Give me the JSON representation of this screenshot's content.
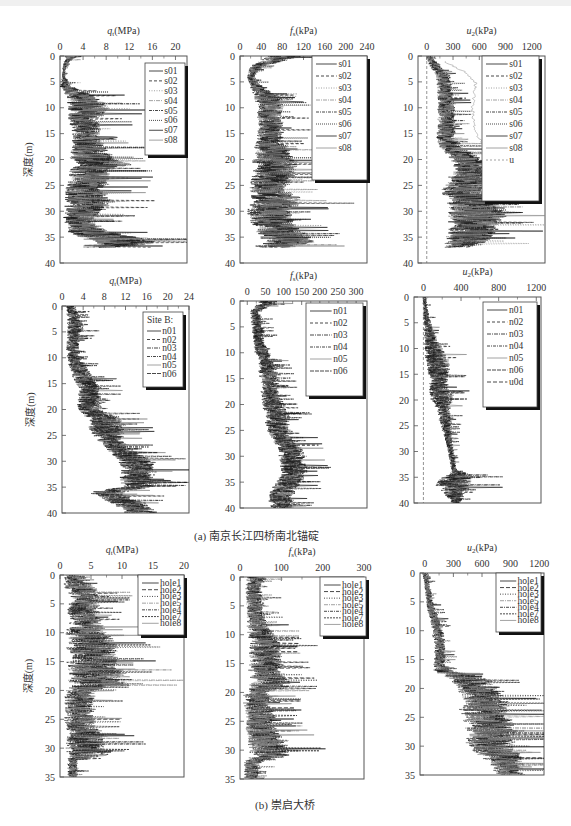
{
  "figure": {
    "caption_a": "(a) 南京长江四桥南北锚碇",
    "caption_b": "(b) 崇启大桥",
    "depth_label": "深度(m)"
  },
  "chart_data": [
    {
      "type": "line",
      "id": "a1",
      "title": "",
      "xlabel": "q_t(MPa)",
      "xlabel_main": "q",
      "xlabel_sub": "t",
      "xlabel_unit": "(MPa)",
      "ylabel": "深度(m)",
      "xlim": [
        0,
        22
      ],
      "xticks": [
        0,
        4,
        8,
        12,
        16,
        20
      ],
      "ylim": [
        0,
        40
      ],
      "yticks": [
        0,
        5,
        10,
        15,
        20,
        25,
        30,
        35,
        40
      ],
      "legend_title": "",
      "legend": [
        "s01",
        "s02",
        "s03",
        "s04",
        "s05",
        "s06",
        "s07",
        "s08"
      ],
      "legend_position": "top-right",
      "profile": {
        "depth": [
          0,
          1,
          2,
          4,
          6,
          8,
          10,
          12,
          14,
          16,
          18,
          20,
          21,
          22,
          24,
          26,
          28,
          30,
          32,
          34,
          35,
          36,
          37
        ],
        "mean": [
          2,
          1.2,
          0.8,
          0.6,
          1.2,
          4,
          5,
          4,
          4.5,
          4.5,
          5,
          5.5,
          8,
          5,
          5,
          4,
          5,
          4,
          3,
          5,
          8,
          12,
          6
        ],
        "spread": [
          1.5,
          0.6,
          0.4,
          0.3,
          1.5,
          3.5,
          4.5,
          3.5,
          3,
          3,
          4,
          5,
          6,
          4.5,
          4.5,
          4,
          5,
          4,
          3,
          4.5,
          7,
          7,
          4
        ]
      }
    },
    {
      "type": "line",
      "id": "a2",
      "xlabel": "f_s(kPa)",
      "xlabel_main": "f",
      "xlabel_sub": "s",
      "xlabel_unit": "(kPa)",
      "xlim": [
        0,
        240
      ],
      "xticks": [
        0,
        40,
        80,
        120,
        160,
        200,
        240
      ],
      "ylim": [
        0,
        40
      ],
      "yticks": [
        0,
        5,
        10,
        15,
        20,
        25,
        30,
        35,
        40
      ],
      "legend_title": "",
      "legend": [
        "s01",
        "s02",
        "s03",
        "s04",
        "s05",
        "s06",
        "s07",
        "s08"
      ],
      "legend_position": "top-right",
      "profile": {
        "depth": [
          0,
          1,
          2,
          4,
          6,
          8,
          10,
          12,
          14,
          16,
          18,
          20,
          22,
          24,
          26,
          28,
          30,
          32,
          34,
          35,
          36,
          37
        ],
        "mean": [
          80,
          60,
          30,
          20,
          30,
          50,
          55,
          55,
          55,
          55,
          55,
          60,
          65,
          55,
          50,
          70,
          50,
          55,
          70,
          80,
          90,
          60
        ],
        "spread": [
          40,
          30,
          15,
          8,
          15,
          30,
          30,
          30,
          30,
          30,
          40,
          50,
          50,
          45,
          40,
          60,
          50,
          50,
          55,
          60,
          60,
          50
        ]
      }
    },
    {
      "type": "line",
      "id": "a3",
      "xlabel": "u_2(kPa)",
      "xlabel_main": "u",
      "xlabel_sub": "2",
      "xlabel_unit": "(kPa)",
      "xlim": [
        -100,
        1350
      ],
      "xticks": [
        0,
        300,
        600,
        900,
        1200
      ],
      "ylim": [
        0,
        40
      ],
      "yticks": [
        0,
        5,
        10,
        15,
        20,
        25,
        30,
        35,
        40
      ],
      "legend_title": "",
      "legend": [
        "s01",
        "s02",
        "s03",
        "s04",
        "s05",
        "s06",
        "s07",
        "s08",
        "u"
      ],
      "legend_position": "top-right",
      "profile": {
        "depth": [
          0,
          1,
          2,
          4,
          6,
          8,
          10,
          12,
          14,
          16,
          18,
          20,
          22,
          24,
          26,
          28,
          30,
          32,
          34,
          36,
          37
        ],
        "mean": [
          20,
          50,
          100,
          180,
          200,
          200,
          220,
          220,
          220,
          200,
          300,
          450,
          500,
          450,
          400,
          500,
          550,
          550,
          500,
          450,
          350
        ],
        "spread": [
          30,
          60,
          80,
          100,
          100,
          110,
          120,
          120,
          120,
          120,
          180,
          220,
          250,
          280,
          300,
          350,
          380,
          380,
          350,
          300,
          200
        ]
      },
      "reference_line": {
        "name": "u",
        "depth": [
          0,
          40
        ],
        "value": [
          0,
          0
        ]
      },
      "gray_profile": {
        "depth": [
          1,
          3,
          5,
          6,
          10,
          15,
          17,
          20,
          22
        ],
        "value": [
          200,
          420,
          550,
          560,
          520,
          560,
          650,
          700,
          750
        ]
      }
    },
    {
      "type": "line",
      "id": "b1",
      "xlabel": "q_t(MPa)",
      "xlabel_main": "q",
      "xlabel_sub": "t",
      "xlabel_unit": "(MPa)",
      "ylabel": "深度(m)",
      "xlim": [
        0,
        24
      ],
      "xticks": [
        0,
        4,
        8,
        12,
        16,
        20,
        24
      ],
      "ylim": [
        0,
        40
      ],
      "yticks": [
        0,
        5,
        10,
        15,
        20,
        25,
        30,
        35,
        40
      ],
      "legend_title": "Site B:",
      "legend": [
        "n01",
        "n02",
        "n03",
        "n04",
        "n05",
        "n06"
      ],
      "legend_position": "top-right",
      "profile": {
        "depth": [
          0,
          2,
          4,
          6,
          8,
          10,
          12,
          14,
          16,
          18,
          20,
          22,
          24,
          26,
          28,
          30,
          32,
          34,
          35,
          36,
          38,
          40
        ],
        "mean": [
          1.5,
          2,
          2.5,
          2,
          2,
          2,
          3,
          4,
          5,
          5,
          5,
          8,
          8,
          9,
          11,
          14,
          14,
          14,
          14,
          8,
          12,
          15
        ],
        "spread": [
          1,
          1.5,
          2,
          1.5,
          1.5,
          1.5,
          2,
          2.5,
          2.5,
          2.5,
          3,
          4,
          4,
          3,
          3,
          4,
          4,
          4,
          4,
          4,
          4,
          4
        ]
      }
    },
    {
      "type": "line",
      "id": "b2",
      "xlabel": "f_s(kPa)",
      "xlabel_main": "f",
      "xlabel_sub": "s",
      "xlabel_unit": "(kPa)",
      "xlim": [
        -20,
        330
      ],
      "xticks": [
        0,
        50,
        100,
        150,
        200,
        250,
        300
      ],
      "ylim": [
        0,
        40
      ],
      "yticks": [
        0,
        5,
        10,
        15,
        20,
        25,
        30,
        35,
        40
      ],
      "legend_title": "",
      "legend": [
        "n01",
        "n02",
        "n03",
        "n04",
        "n05",
        "n06"
      ],
      "legend_position": "top-right",
      "profile": {
        "depth": [
          0,
          1,
          2,
          4,
          6,
          8,
          10,
          12,
          14,
          16,
          18,
          20,
          22,
          24,
          26,
          28,
          30,
          32,
          34,
          36,
          38,
          40
        ],
        "mean": [
          60,
          40,
          20,
          25,
          30,
          30,
          40,
          50,
          55,
          60,
          60,
          70,
          80,
          80,
          90,
          110,
          120,
          125,
          120,
          100,
          90,
          95
        ],
        "spread": [
          40,
          25,
          15,
          20,
          20,
          20,
          25,
          25,
          30,
          30,
          30,
          35,
          40,
          40,
          40,
          40,
          45,
          45,
          45,
          40,
          40,
          40
        ]
      }
    },
    {
      "type": "line",
      "id": "b3",
      "xlabel": "u_2(kPa)",
      "xlabel_main": "u",
      "xlabel_sub": "2",
      "xlabel_unit": "(kPa)",
      "xlim": [
        -100,
        1250
      ],
      "xticks": [
        0,
        400,
        800,
        1200
      ],
      "ylim": [
        0,
        40
      ],
      "yticks": [
        0,
        5,
        10,
        15,
        20,
        25,
        30,
        35,
        40
      ],
      "legend_title": "",
      "legend": [
        "n01",
        "n02",
        "n03",
        "n04",
        "n05",
        "n06",
        "u0d"
      ],
      "legend_position": "top-right",
      "profile": {
        "depth": [
          0,
          2,
          4,
          6,
          8,
          10,
          12,
          14,
          16,
          18,
          20,
          22,
          24,
          26,
          28,
          30,
          32,
          34,
          35,
          36,
          38,
          40
        ],
        "mean": [
          10,
          20,
          30,
          50,
          70,
          100,
          130,
          150,
          160,
          170,
          190,
          210,
          230,
          250,
          270,
          290,
          310,
          330,
          340,
          300,
          320,
          350
        ],
        "spread": [
          20,
          30,
          40,
          60,
          80,
          120,
          150,
          150,
          120,
          150,
          150,
          80,
          80,
          60,
          50,
          40,
          40,
          40,
          200,
          250,
          150,
          60
        ]
      },
      "reference_line": {
        "name": "u0d",
        "depth": [
          0,
          40
        ],
        "value": [
          0,
          0
        ]
      }
    },
    {
      "type": "line",
      "id": "c1",
      "xlabel": "q_t(MPa)",
      "xlabel_main": "q",
      "xlabel_sub": "t",
      "xlabel_unit": "(MPa)",
      "ylabel": "深度(m)",
      "xlim": [
        0,
        20
      ],
      "xticks": [
        0,
        5,
        10,
        15,
        20
      ],
      "ylim": [
        0,
        35
      ],
      "yticks": [
        0,
        5,
        10,
        15,
        20,
        25,
        30,
        35
      ],
      "legend_title": "",
      "legend": [
        "hole1",
        "hole2",
        "hole3",
        "hole5",
        "hole4",
        "hole7",
        "hole8"
      ],
      "legend_position": "top-right",
      "profile": {
        "depth": [
          0,
          2,
          4,
          6,
          8,
          10,
          12,
          14,
          16,
          18,
          19,
          20,
          22,
          24,
          26,
          28,
          30,
          31,
          32,
          35
        ],
        "mean": [
          1.5,
          3,
          4,
          3.5,
          4,
          4,
          5,
          5,
          5,
          6,
          6,
          3,
          3,
          3,
          3,
          4,
          4,
          5,
          2,
          2
        ],
        "spread": [
          1,
          3,
          3,
          3,
          3,
          4,
          5,
          5,
          5,
          6,
          6,
          3,
          3,
          3,
          3,
          4,
          4,
          5,
          1,
          1
        ]
      }
    },
    {
      "type": "line",
      "id": "c2",
      "xlabel": "f_s(kPa)",
      "xlabel_main": "f",
      "xlabel_sub": "s",
      "xlabel_unit": "(kPa)",
      "xlim": [
        0,
        300
      ],
      "xticks": [
        0,
        100,
        200,
        300
      ],
      "ylim": [
        0,
        35
      ],
      "yticks": [
        0,
        5,
        10,
        15,
        20,
        25,
        30,
        35
      ],
      "legend_title": "",
      "legend": [
        "hole1",
        "hole2",
        "hole3",
        "hole5",
        "hole4",
        "hole7",
        "hole8"
      ],
      "legend_position": "top-right",
      "profile": {
        "depth": [
          0,
          2,
          4,
          6,
          8,
          10,
          12,
          14,
          16,
          18,
          19,
          20,
          22,
          24,
          26,
          28,
          30,
          31,
          32,
          35
        ],
        "mean": [
          40,
          30,
          35,
          35,
          40,
          50,
          60,
          60,
          60,
          70,
          70,
          40,
          40,
          50,
          45,
          60,
          65,
          70,
          30,
          25
        ],
        "spread": [
          30,
          25,
          25,
          25,
          30,
          40,
          50,
          50,
          50,
          60,
          60,
          40,
          40,
          45,
          40,
          55,
          60,
          60,
          25,
          20
        ]
      }
    },
    {
      "type": "line",
      "id": "c3",
      "xlabel": "u_2(kPa)",
      "xlabel_main": "u",
      "xlabel_sub": "2",
      "xlabel_unit": "(kPa)",
      "xlim": [
        -50,
        1250
      ],
      "xticks": [
        0,
        300,
        600,
        900,
        1200
      ],
      "ylim": [
        0,
        35
      ],
      "yticks": [
        0,
        5,
        10,
        15,
        20,
        25,
        30,
        35
      ],
      "legend_title": "",
      "legend": [
        "hole1",
        "hole2",
        "hole3",
        "hole5",
        "hole4",
        "hole7",
        "hole8"
      ],
      "legend_position": "top-right",
      "profile": {
        "depth": [
          0,
          2,
          4,
          6,
          8,
          10,
          12,
          14,
          16,
          17,
          18,
          20,
          22,
          24,
          26,
          28,
          30,
          32,
          34,
          35
        ],
        "mean": [
          0,
          20,
          40,
          60,
          100,
          130,
          150,
          150,
          150,
          200,
          400,
          550,
          600,
          600,
          650,
          700,
          650,
          800,
          850,
          900
        ],
        "spread": [
          30,
          40,
          40,
          50,
          60,
          70,
          70,
          70,
          80,
          150,
          250,
          280,
          300,
          300,
          300,
          300,
          300,
          250,
          200,
          150
        ]
      }
    }
  ]
}
